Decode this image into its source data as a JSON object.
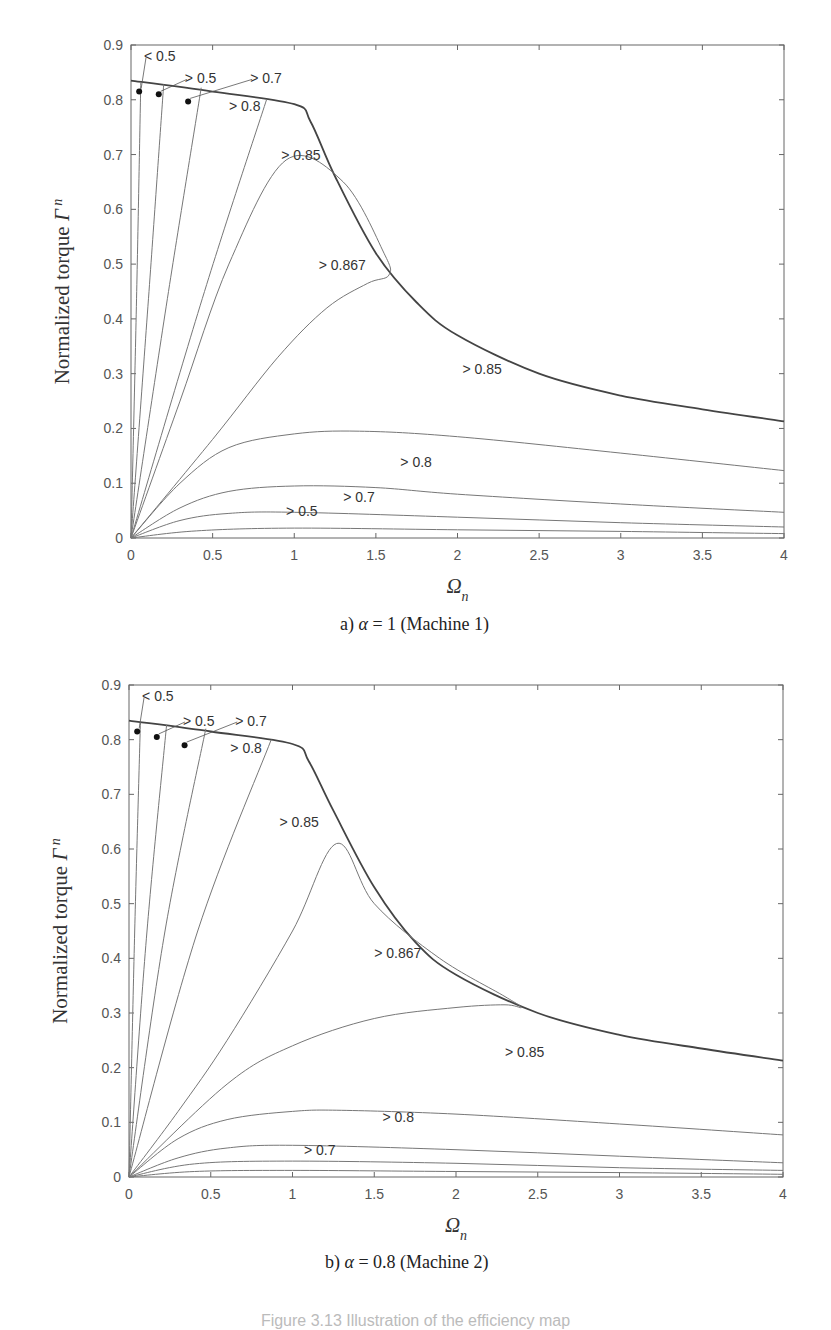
{
  "chart_data": [
    {
      "type": "line",
      "subtype": "efficiency contour map",
      "title": "",
      "caption": "a) α = 1 (Machine 1)",
      "caption_parts": {
        "prefix": "a) ",
        "symbol": "α",
        "rest": " = 1 (Machine 1)"
      },
      "xlabel": "Ω_n",
      "ylabel": "Normalized torque Γ_n",
      "xlim": [
        0,
        4
      ],
      "ylim": [
        0,
        0.9
      ],
      "xticks": [
        "0",
        "0.5",
        "1",
        "1.5",
        "2",
        "2.5",
        "3",
        "3.5",
        "4"
      ],
      "yticks": [
        "0",
        "0.1",
        "0.2",
        "0.3",
        "0.4",
        "0.5",
        "0.6",
        "0.7",
        "0.8",
        "0.9"
      ],
      "grid": false,
      "series": [
        {
          "name": "max torque envelope",
          "x": [
            0,
            0.5,
            1.0,
            1.1,
            1.25,
            1.5,
            1.75,
            2.0,
            2.5,
            3.0,
            3.5,
            4.0
          ],
          "y": [
            0.835,
            0.815,
            0.792,
            0.76,
            0.66,
            0.52,
            0.43,
            0.37,
            0.3,
            0.26,
            0.235,
            0.213
          ]
        },
        {
          "name": "0.5 efficiency (steep)",
          "x": [
            0,
            0.035,
            0.06
          ],
          "y": [
            0,
            0.45,
            0.832
          ]
        },
        {
          "name": "0.7 efficiency (steep)",
          "x": [
            0,
            0.11,
            0.2
          ],
          "y": [
            0,
            0.45,
            0.828
          ]
        },
        {
          "name": "0.8 efficiency (steep)",
          "x": [
            0,
            0.23,
            0.43
          ],
          "y": [
            0,
            0.45,
            0.822
          ]
        },
        {
          "name": "0.85 efficiency (steep)",
          "x": [
            0,
            0.45,
            0.83
          ],
          "y": [
            0,
            0.45,
            0.8
          ]
        },
        {
          "name": "0.867 contour",
          "x": [
            0,
            0.5,
            0.9,
            1.2,
            1.45,
            1.58,
            1.55,
            1.3,
            0.95,
            0.6,
            0.3,
            0
          ],
          "y": [
            0,
            0.18,
            0.33,
            0.42,
            0.465,
            0.48,
            0.52,
            0.65,
            0.69,
            0.5,
            0.25,
            0
          ]
        },
        {
          "name": "0.85 efficiency (low)",
          "x": [
            0,
            0.3,
            0.6,
            1.0,
            1.4,
            2.0,
            3.0,
            4.0
          ],
          "y": [
            0,
            0.1,
            0.165,
            0.19,
            0.195,
            0.185,
            0.155,
            0.123
          ]
        },
        {
          "name": "0.8 efficiency (low)",
          "x": [
            0,
            0.3,
            0.6,
            1.0,
            1.5,
            2.0,
            3.0,
            4.0
          ],
          "y": [
            0,
            0.055,
            0.085,
            0.095,
            0.092,
            0.08,
            0.062,
            0.047
          ]
        },
        {
          "name": "0.7 efficiency (low)",
          "x": [
            0,
            0.3,
            0.6,
            1.0,
            2.0,
            3.0,
            4.0
          ],
          "y": [
            0,
            0.032,
            0.045,
            0.047,
            0.038,
            0.028,
            0.02
          ]
        },
        {
          "name": "0.5 efficiency (low)",
          "x": [
            0,
            0.4,
            1.0,
            2.0,
            3.0,
            4.0
          ],
          "y": [
            0,
            0.013,
            0.018,
            0.015,
            0.012,
            0.008
          ]
        }
      ],
      "annotations": [
        {
          "text": "< 0.5",
          "x": 0.08,
          "y": 0.87,
          "marker": {
            "x": 0.05,
            "y": 0.815
          }
        },
        {
          "text": "> 0.5",
          "x": 0.33,
          "y": 0.83,
          "marker": {
            "x": 0.17,
            "y": 0.81
          }
        },
        {
          "text": "> 0.7",
          "x": 0.73,
          "y": 0.83,
          "marker": {
            "x": 0.35,
            "y": 0.797
          }
        },
        {
          "text": "> 0.8",
          "x": 0.6,
          "y": 0.78
        },
        {
          "text": "> 0.85",
          "x": 0.92,
          "y": 0.69
        },
        {
          "text": "> 0.867",
          "x": 1.15,
          "y": 0.49
        },
        {
          "text": "> 0.85",
          "x": 2.03,
          "y": 0.3
        },
        {
          "text": "> 0.8",
          "x": 1.65,
          "y": 0.13
        },
        {
          "text": "> 0.7",
          "x": 1.3,
          "y": 0.065
        },
        {
          "text": "> 0.5",
          "x": 0.95,
          "y": 0.04
        }
      ]
    },
    {
      "type": "line",
      "subtype": "efficiency contour map",
      "title": "",
      "caption": "b) α = 0.8 (Machine 2)",
      "caption_parts": {
        "prefix": "b) ",
        "symbol": "α",
        "rest": " = 0.8 (Machine 2)"
      },
      "xlabel": "Ω_n",
      "ylabel": "Normalized torque Γ_n",
      "xlim": [
        0,
        4
      ],
      "ylim": [
        0,
        0.9
      ],
      "xticks": [
        "0",
        "0.5",
        "1",
        "1.5",
        "2",
        "2.5",
        "3",
        "3.5",
        "4"
      ],
      "yticks": [
        "0",
        "0.1",
        "0.2",
        "0.3",
        "0.4",
        "0.5",
        "0.6",
        "0.7",
        "0.8",
        "0.9"
      ],
      "grid": false,
      "series": [
        {
          "name": "max torque envelope",
          "x": [
            0,
            0.5,
            1.0,
            1.1,
            1.25,
            1.5,
            1.75,
            2.0,
            2.5,
            3.0,
            3.5,
            4.0
          ],
          "y": [
            0.835,
            0.815,
            0.792,
            0.76,
            0.67,
            0.53,
            0.43,
            0.37,
            0.3,
            0.26,
            0.235,
            0.213
          ]
        },
        {
          "name": "0.5 efficiency (steep)",
          "x": [
            0,
            0.035,
            0.07
          ],
          "y": [
            0,
            0.45,
            0.832
          ]
        },
        {
          "name": "0.7 efficiency (steep)",
          "x": [
            0,
            0.11,
            0.23
          ],
          "y": [
            0,
            0.45,
            0.827
          ]
        },
        {
          "name": "0.8 efficiency (steep)",
          "x": [
            0,
            0.22,
            0.47
          ],
          "y": [
            0,
            0.45,
            0.82
          ]
        },
        {
          "name": "0.85 efficiency (steep)",
          "x": [
            0,
            0.42,
            0.87
          ],
          "y": [
            0,
            0.45,
            0.8
          ]
        },
        {
          "name": "0.867 contour",
          "x": [
            0,
            0.6,
            1.0,
            1.5,
            2.0,
            2.3,
            2.4,
            2.3,
            1.9,
            1.5,
            1.27,
            1.0,
            0.6,
            0.3,
            0
          ],
          "y": [
            0,
            0.17,
            0.24,
            0.29,
            0.31,
            0.315,
            0.31,
            0.33,
            0.4,
            0.5,
            0.61,
            0.45,
            0.25,
            0.12,
            0
          ]
        },
        {
          "name": "0.85 efficiency (low)",
          "x": [
            0,
            0.3,
            0.6,
            1.0,
            1.3,
            2.0,
            3.0,
            4.0
          ],
          "y": [
            0,
            0.07,
            0.105,
            0.12,
            0.122,
            0.115,
            0.097,
            0.077
          ]
        },
        {
          "name": "0.8 efficiency (low)",
          "x": [
            0,
            0.3,
            0.6,
            1.0,
            2.0,
            3.0,
            4.0
          ],
          "y": [
            0,
            0.035,
            0.053,
            0.058,
            0.05,
            0.038,
            0.026
          ]
        },
        {
          "name": "0.7 efficiency (low)",
          "x": [
            0,
            0.4,
            1.0,
            2.0,
            3.0,
            4.0
          ],
          "y": [
            0,
            0.024,
            0.029,
            0.025,
            0.017,
            0.012
          ]
        },
        {
          "name": "0.5 efficiency (low)",
          "x": [
            0,
            0.4,
            1.0,
            2.0,
            3.0,
            4.0
          ],
          "y": [
            0,
            0.01,
            0.012,
            0.01,
            0.008,
            0.005
          ]
        }
      ],
      "annotations": [
        {
          "text": "< 0.5",
          "x": 0.08,
          "y": 0.87,
          "marker": {
            "x": 0.05,
            "y": 0.815
          }
        },
        {
          "text": "> 0.5",
          "x": 0.33,
          "y": 0.825,
          "marker": {
            "x": 0.17,
            "y": 0.805
          }
        },
        {
          "text": "> 0.7",
          "x": 0.65,
          "y": 0.825,
          "marker": {
            "x": 0.34,
            "y": 0.79
          }
        },
        {
          "text": "> 0.8",
          "x": 0.62,
          "y": 0.775
        },
        {
          "text": "> 0.85",
          "x": 0.92,
          "y": 0.64
        },
        {
          "text": "> 0.867",
          "x": 1.5,
          "y": 0.4
        },
        {
          "text": "> 0.85",
          "x": 2.3,
          "y": 0.22
        },
        {
          "text": "> 0.8",
          "x": 1.55,
          "y": 0.1
        },
        {
          "text": "> 0.7",
          "x": 1.07,
          "y": 0.04
        }
      ]
    }
  ],
  "figure_caption": "Figure 3.13  Illustration of the efficiency map"
}
